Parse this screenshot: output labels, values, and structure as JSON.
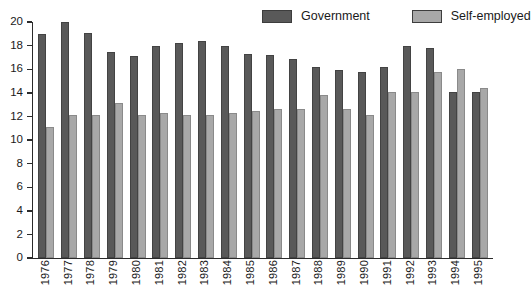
{
  "chart_data": {
    "type": "bar",
    "title": "",
    "xlabel": "",
    "ylabel": "",
    "ylim": [
      0,
      20
    ],
    "y_ticks": [
      0,
      2,
      4,
      6,
      8,
      10,
      12,
      14,
      16,
      18,
      20
    ],
    "grid": false,
    "legend_position": "top-right",
    "categories": [
      "1976",
      "1977",
      "1978",
      "1979",
      "1980",
      "1981",
      "1982",
      "1983",
      "1984",
      "1985",
      "1986",
      "1987",
      "1988",
      "1989",
      "1990",
      "1991",
      "1992",
      "1993",
      "1994",
      "1995"
    ],
    "series": [
      {
        "name": "Government",
        "color": "#595959",
        "values": [
          19.0,
          20.0,
          19.1,
          17.5,
          17.1,
          18.0,
          18.2,
          18.4,
          18.0,
          17.3,
          17.2,
          16.9,
          16.2,
          15.9,
          15.8,
          16.2,
          18.0,
          17.8,
          14.1,
          14.1
        ]
      },
      {
        "name": "Self-employed",
        "color": "#a8a8a8",
        "values": [
          11.1,
          12.1,
          12.1,
          13.1,
          12.1,
          12.3,
          12.1,
          12.1,
          12.3,
          12.5,
          12.6,
          12.6,
          13.8,
          12.6,
          12.1,
          14.1,
          14.1,
          15.8,
          16.0,
          14.4
        ]
      }
    ]
  },
  "legend": {
    "items": [
      {
        "label": "Government"
      },
      {
        "label": "Self-employed"
      }
    ]
  },
  "colors": {
    "government": "#595959",
    "self_employed": "#a8a8a8",
    "axis": "#2b2b2b",
    "background": "#ffffff",
    "text": "#1a1a1a"
  }
}
